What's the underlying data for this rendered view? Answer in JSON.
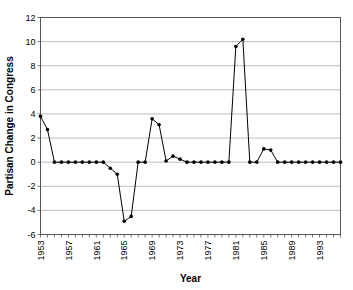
{
  "chart_data": {
    "type": "line",
    "title": "",
    "xlabel": "Year",
    "ylabel": "Partisan Change in Congress",
    "xlim": [
      1953,
      1996
    ],
    "ylim": [
      -6,
      12
    ],
    "ytick_step": 2,
    "xtick_step": 1,
    "xtick_label_step": 4,
    "grid": "horizontal",
    "legend": "none",
    "marker": "filled-circle",
    "yticks": [
      -6,
      -4,
      -2,
      0,
      2,
      4,
      6,
      8,
      10,
      12
    ],
    "ytick_labels": [
      "-6",
      "-4",
      "-2",
      "0",
      "2",
      "4",
      "6",
      "8",
      "10",
      "12"
    ],
    "xticks": [
      1953,
      1954,
      1955,
      1956,
      1957,
      1958,
      1959,
      1960,
      1961,
      1962,
      1963,
      1964,
      1965,
      1966,
      1967,
      1968,
      1969,
      1970,
      1971,
      1972,
      1973,
      1974,
      1975,
      1976,
      1977,
      1978,
      1979,
      1980,
      1981,
      1982,
      1983,
      1984,
      1985,
      1986,
      1987,
      1988,
      1989,
      1990,
      1991,
      1992,
      1993,
      1994,
      1995,
      1996
    ],
    "xtick_labels": [
      "1953",
      "1957",
      "1961",
      "1965",
      "1969",
      "1973",
      "1977",
      "1981",
      "1985",
      "1989",
      "1993"
    ],
    "x": [
      1953,
      1954,
      1955,
      1956,
      1957,
      1958,
      1959,
      1960,
      1961,
      1962,
      1963,
      1964,
      1965,
      1966,
      1967,
      1968,
      1969,
      1970,
      1971,
      1972,
      1973,
      1974,
      1975,
      1976,
      1977,
      1978,
      1979,
      1980,
      1981,
      1982,
      1983,
      1984,
      1985,
      1986,
      1987,
      1988,
      1989,
      1990,
      1991,
      1992,
      1993,
      1994,
      1995,
      1996
    ],
    "values": [
      3.8,
      2.7,
      0,
      0,
      0,
      0,
      0,
      0,
      0,
      0,
      -0.5,
      -1.0,
      -4.9,
      -4.5,
      0,
      0,
      3.6,
      3.1,
      0.1,
      0.5,
      0.25,
      0,
      0,
      0,
      0,
      0,
      0,
      0,
      9.6,
      10.2,
      0,
      0,
      1.1,
      1.0,
      0,
      0,
      0,
      0,
      0,
      0,
      0,
      0,
      0,
      0
    ]
  },
  "colors": {
    "series": "#000000",
    "grid": "#aaaaaa",
    "axis": "#555555",
    "background": "#ffffff"
  }
}
